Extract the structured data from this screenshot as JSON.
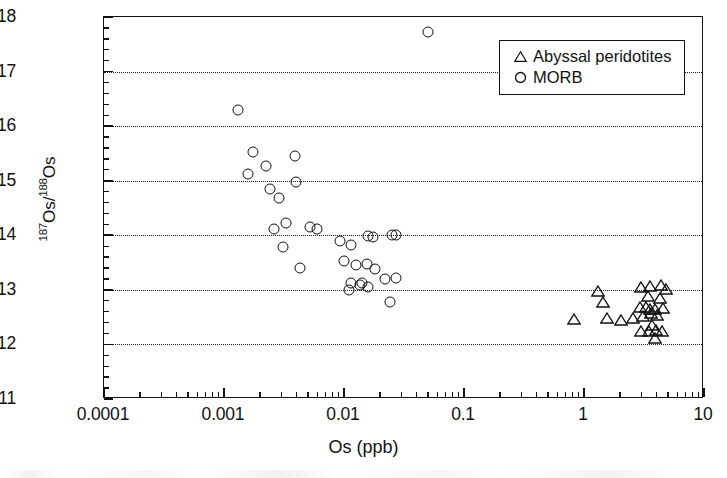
{
  "chart_data": {
    "type": "scatter",
    "title": "",
    "xlabel": "Os (ppb)",
    "ylabel": "187Os/188Os",
    "ylabel_parts": {
      "sup1": "187",
      "mid": "Os/",
      "sup2": "188",
      "tail": "Os"
    },
    "xscale": "log",
    "yscale": "linear",
    "xlim": [
      0.0001,
      10
    ],
    "ylim": [
      0.11,
      0.18
    ],
    "xticks": [
      0.0001,
      0.001,
      0.01,
      0.1,
      1,
      10
    ],
    "xtick_labels": [
      "0.0001",
      "0.001",
      "0.01",
      "0.1",
      "1",
      "10"
    ],
    "yticks": [
      0.11,
      0.12,
      0.13,
      0.14,
      0.15,
      0.16,
      0.17,
      0.18
    ],
    "ytick_labels": [
      "0.11",
      "0.12",
      "0.13",
      "0.14",
      "0.15",
      "0.16",
      "0.17",
      "0.18"
    ],
    "ytick_minor_step": 0.002,
    "grid": {
      "horizontal": true,
      "style": "dotted",
      "at": [
        0.12,
        0.13,
        0.14,
        0.15,
        0.16,
        0.17
      ]
    },
    "legend": {
      "position": "top-right",
      "entries": [
        {
          "label": "Abyssal peridotites",
          "marker": "triangle"
        },
        {
          "label": "MORB",
          "marker": "circle"
        }
      ]
    },
    "series": [
      {
        "name": "MORB",
        "marker": "circle",
        "color": "#111111",
        "points": [
          [
            0.05,
            0.1773
          ],
          [
            0.0013,
            0.163
          ],
          [
            0.00175,
            0.1553
          ],
          [
            0.0039,
            0.1545
          ],
          [
            0.00225,
            0.1527
          ],
          [
            0.0016,
            0.1512
          ],
          [
            0.004,
            0.1497
          ],
          [
            0.0024,
            0.1485
          ],
          [
            0.00285,
            0.1468
          ],
          [
            0.0026,
            0.1412
          ],
          [
            0.0033,
            0.1423
          ],
          [
            0.0052,
            0.1415
          ],
          [
            0.006,
            0.1412
          ],
          [
            0.0031,
            0.1378
          ],
          [
            0.0093,
            0.139
          ],
          [
            0.0115,
            0.1382
          ],
          [
            0.016,
            0.1398
          ],
          [
            0.0175,
            0.1396
          ],
          [
            0.025,
            0.14
          ],
          [
            0.027,
            0.14
          ],
          [
            0.0043,
            0.134
          ],
          [
            0.01,
            0.1352
          ],
          [
            0.0125,
            0.1345
          ],
          [
            0.0155,
            0.1348
          ],
          [
            0.018,
            0.1338
          ],
          [
            0.0115,
            0.1312
          ],
          [
            0.0135,
            0.1308
          ],
          [
            0.014,
            0.1312
          ],
          [
            0.016,
            0.1305
          ],
          [
            0.022,
            0.132
          ],
          [
            0.027,
            0.1322
          ],
          [
            0.011,
            0.13
          ],
          [
            0.024,
            0.1278
          ]
        ]
      },
      {
        "name": "Abyssal peridotites",
        "marker": "triangle",
        "color": "#111111",
        "points": [
          [
            0.82,
            0.125
          ],
          [
            1.3,
            0.1302
          ],
          [
            1.45,
            0.1282
          ],
          [
            1.55,
            0.1252
          ],
          [
            2.05,
            0.1248
          ],
          [
            2.55,
            0.1252
          ],
          [
            3.0,
            0.1308
          ],
          [
            3.55,
            0.131
          ],
          [
            3.4,
            0.1292
          ],
          [
            4.3,
            0.1288
          ],
          [
            2.95,
            0.1272
          ],
          [
            3.3,
            0.1272
          ],
          [
            3.55,
            0.1268
          ],
          [
            3.9,
            0.1268
          ],
          [
            4.55,
            0.127
          ],
          [
            3.1,
            0.1255
          ],
          [
            3.6,
            0.1262
          ],
          [
            4.05,
            0.1258
          ],
          [
            3.7,
            0.124
          ],
          [
            3.0,
            0.1228
          ],
          [
            3.45,
            0.1228
          ],
          [
            4.0,
            0.123
          ],
          [
            4.45,
            0.1228
          ],
          [
            3.9,
            0.1215
          ],
          [
            4.4,
            0.1312
          ],
          [
            4.8,
            0.1305
          ]
        ]
      }
    ]
  },
  "axis": {
    "x_title": "Os (ppb)",
    "y_title_sup1": "187",
    "y_title_mid": "Os/",
    "y_title_sup2": "188",
    "y_title_tail": "Os"
  },
  "legend": {
    "peridotites_label": "Abyssal peridotites",
    "morb_label": "MORB"
  },
  "colors": {
    "axis": "#111111",
    "grid": "#1a1a1a",
    "marker": "#111111",
    "background": "#ffffff"
  }
}
